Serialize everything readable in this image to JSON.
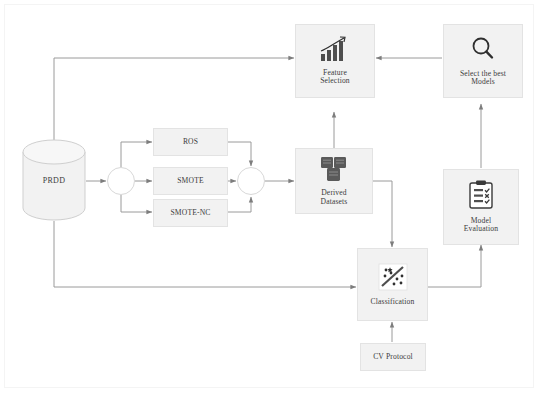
{
  "diagram": {
    "colors": {
      "node_fill": "#f2f2f2",
      "node_border": "#e3e3e3",
      "wire": "#9a9a9a",
      "text": "#3b3b3b",
      "icon_dark": "#5a5a5a",
      "canvas": "#ffffff"
    },
    "nodes": {
      "source": {
        "label": "PRDD",
        "shape": "cylinder",
        "icon": "database-cylinder-icon"
      },
      "split": {
        "label": "",
        "shape": "circle",
        "icon": "split-junction-icon"
      },
      "ros": {
        "label": "ROS",
        "shape": "rect"
      },
      "smote": {
        "label": "SMOTE",
        "shape": "rect"
      },
      "smote_nc": {
        "label": "SMOTE-NC",
        "shape": "rect"
      },
      "merge": {
        "label": "",
        "shape": "circle",
        "icon": "merge-junction-icon"
      },
      "derived_datasets": {
        "label": "Derived\nDatasets",
        "shape": "rect",
        "icon": "stacked-datasets-icon"
      },
      "feature_selection": {
        "label": "Feature\nSelection",
        "shape": "rect",
        "icon": "bar-chart-trend-icon"
      },
      "select_best_models": {
        "label": "Select the best\nModels",
        "shape": "rect",
        "icon": "magnifier-icon"
      },
      "model_evaluation": {
        "label": "Model\nEvaluation",
        "shape": "rect",
        "icon": "clipboard-checklist-icon"
      },
      "classification": {
        "label": "Classification",
        "shape": "rect",
        "icon": "scatter-separator-icon"
      },
      "cv_protocol": {
        "label": "CV Protocol",
        "shape": "rect"
      }
    },
    "edges": [
      {
        "from": "source",
        "to": "split"
      },
      {
        "from": "split",
        "to": "ros"
      },
      {
        "from": "split",
        "to": "smote"
      },
      {
        "from": "split",
        "to": "smote_nc"
      },
      {
        "from": "ros",
        "to": "merge"
      },
      {
        "from": "smote",
        "to": "merge"
      },
      {
        "from": "smote_nc",
        "to": "merge"
      },
      {
        "from": "merge",
        "to": "derived_datasets"
      },
      {
        "from": "derived_datasets",
        "to": "feature_selection"
      },
      {
        "from": "derived_datasets",
        "to": "classification"
      },
      {
        "from": "source",
        "to": "feature_selection"
      },
      {
        "from": "source",
        "to": "classification"
      },
      {
        "from": "feature_selection",
        "to": "classification"
      },
      {
        "from": "select_best_models",
        "to": "feature_selection"
      },
      {
        "from": "classification",
        "to": "model_evaluation"
      },
      {
        "from": "model_evaluation",
        "to": "select_best_models"
      },
      {
        "from": "cv_protocol",
        "to": "classification"
      }
    ]
  }
}
